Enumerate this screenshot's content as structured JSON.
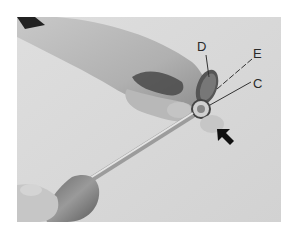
{
  "figure": {
    "background_color": "#d9d9d9",
    "callouts": [
      {
        "id": "D",
        "label": "D"
      },
      {
        "id": "E",
        "label": "E"
      },
      {
        "id": "C",
        "label": "C"
      }
    ],
    "arrow": {
      "direction": "up-left",
      "color": "#111111"
    }
  }
}
